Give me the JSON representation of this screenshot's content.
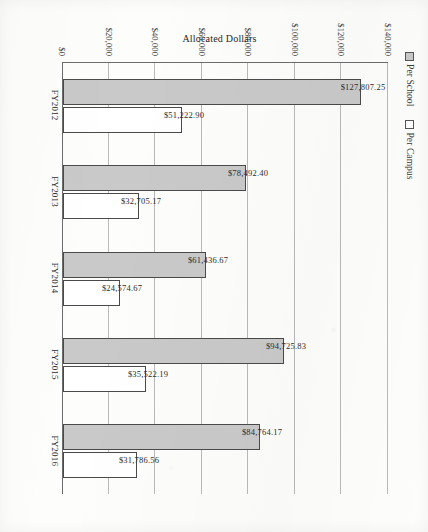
{
  "chart_data": {
    "type": "bar",
    "title": "",
    "xlabel": "",
    "ylabel": "Allocated Dollars",
    "categories": [
      "FY2012",
      "FY2013",
      "FY2014",
      "FY2015",
      "FY2016"
    ],
    "series": [
      {
        "name": "Per School",
        "color": "#c9c9c9",
        "values": [
          127807.25,
          78492.4,
          61436.67,
          94725.83,
          84764.17
        ],
        "labels": [
          "$127,807.25",
          "$78,492.40",
          "$61,436.67",
          "$94,725.83",
          "$84,764.17"
        ]
      },
      {
        "name": "Per Campus",
        "color": "#ffffff",
        "values": [
          51222.9,
          32705.17,
          24574.67,
          35522.19,
          31786.56
        ],
        "labels": [
          "$51,222.90",
          "$32,705.17",
          "$24,574.67",
          "$35,522.19",
          "$31,786.56"
        ]
      }
    ],
    "ylim": [
      0,
      140000
    ],
    "yticks": [
      0,
      20000,
      40000,
      60000,
      80000,
      100000,
      120000,
      140000
    ],
    "ytick_labels": [
      "$0",
      "$20,000",
      "$40,000",
      "$60,000",
      "$80,000",
      "$100,000",
      "$120,000",
      "$140,000"
    ],
    "grid": "horizontal",
    "legend_position": "top-left"
  },
  "legend": {
    "items": [
      {
        "label": "Per School",
        "swatch": "filled-gray-square-icon"
      },
      {
        "label": "Per Campus",
        "swatch": "outline-white-square-icon"
      }
    ]
  }
}
